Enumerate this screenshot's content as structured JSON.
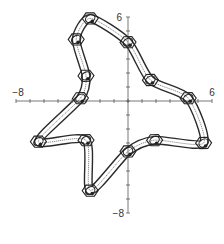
{
  "chart_data": {
    "type": "line",
    "title": "",
    "xlabel": "",
    "ylabel": "",
    "xlim": [
      -8,
      6
    ],
    "ylim": [
      -8,
      6
    ],
    "grid": false,
    "legend": null,
    "x_tick_labels": [
      "-8",
      "6"
    ],
    "y_tick_labels": [
      "6",
      "-8"
    ],
    "series": [
      {
        "name": "closed curve",
        "closed": true,
        "points": [
          [
            -2.7,
            5.9
          ],
          [
            0.0,
            4.2
          ],
          [
            1.6,
            1.5
          ],
          [
            4.3,
            0.2
          ],
          [
            5.4,
            -3.0
          ],
          [
            1.9,
            -2.8
          ],
          [
            0.0,
            -3.6
          ],
          [
            -2.7,
            -6.4
          ],
          [
            -3.0,
            -2.8
          ],
          [
            -6.4,
            -2.9
          ],
          [
            -3.4,
            0.2
          ],
          [
            -3.0,
            1.8
          ],
          [
            -3.7,
            4.4
          ]
        ]
      }
    ],
    "loop_nodes": [
      [
        -2.7,
        5.9
      ],
      [
        -3.7,
        4.4
      ],
      [
        0.0,
        4.2
      ],
      [
        1.6,
        1.5
      ],
      [
        -3.0,
        1.8
      ],
      [
        -3.4,
        0.2
      ],
      [
        4.3,
        0.2
      ],
      [
        -6.4,
        -2.9
      ],
      [
        -3.0,
        -2.8
      ],
      [
        0.0,
        -3.6
      ],
      [
        1.9,
        -2.8
      ],
      [
        5.4,
        -3.0
      ],
      [
        -2.7,
        -6.4
      ]
    ]
  },
  "axes": {
    "x_min_label": "−8",
    "x_max_label": "6",
    "y_max_label": "6",
    "y_min_label": "−8"
  }
}
